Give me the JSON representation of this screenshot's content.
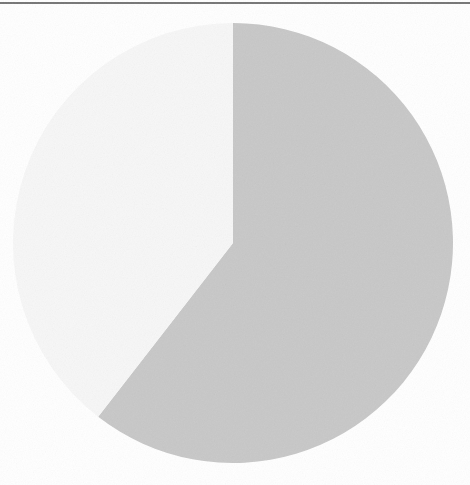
{
  "figure": {
    "background_color": "#ffffff",
    "width": 470,
    "height": 485,
    "rule_color": "#5e5e5e"
  },
  "chart_data": {
    "type": "pie",
    "title": "",
    "subtitle": "",
    "xlabel": "",
    "ylabel": "",
    "grid": false,
    "legend": "none",
    "labels": [
      "Slice 1",
      "Slice 2"
    ],
    "values": [
      60.5,
      39.5
    ],
    "percentages": [
      "60.5%",
      "39.5%"
    ],
    "colors": [
      "#c8c8c8",
      "#f7f7f7"
    ],
    "start_angle_deg": 0,
    "direction": "clockwise",
    "center": [
      233,
      243
    ],
    "radius": 220,
    "slices": [
      {
        "label": "Slice 1",
        "value": 60.5,
        "percent": "60.5%",
        "color": "#c8c8c8",
        "start_angle_deg": 0,
        "end_angle_deg": 218,
        "sweep_deg": 218
      },
      {
        "label": "Slice 2",
        "value": 39.5,
        "percent": "39.5%",
        "color": "#f7f7f7",
        "start_angle_deg": 218,
        "end_angle_deg": 360,
        "sweep_deg": 142
      }
    ],
    "annotations": []
  }
}
